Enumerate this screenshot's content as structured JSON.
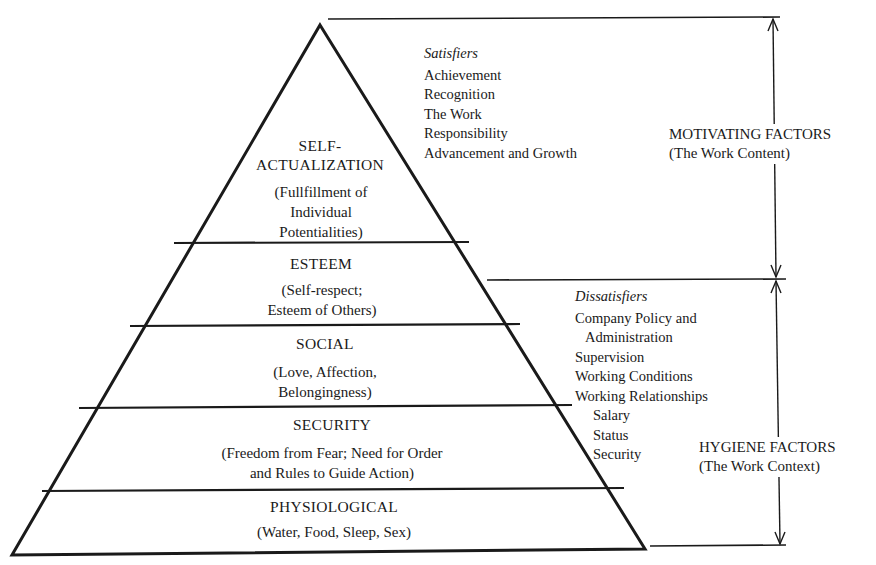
{
  "pyramid": {
    "tiers": [
      {
        "title_lines": [
          "SELF-",
          "ACTUALIZATION"
        ],
        "desc_lines": [
          "(Fullfillment of",
          "Individual",
          "Potentialities)"
        ]
      },
      {
        "title_lines": [
          "ESTEEM"
        ],
        "desc_lines": [
          "(Self-respect;",
          "Esteem of Others)"
        ]
      },
      {
        "title_lines": [
          "SOCIAL"
        ],
        "desc_lines": [
          "(Love, Affection,",
          "Belongingness)"
        ]
      },
      {
        "title_lines": [
          "SECURITY"
        ],
        "desc_lines": [
          "(Freedom from Fear; Need for Order",
          "and Rules to Guide Action)"
        ]
      },
      {
        "title_lines": [
          "PHYSIOLOGICAL"
        ],
        "desc_lines": [
          "(Water, Food, Sleep, Sex)"
        ]
      }
    ]
  },
  "satisfiers": {
    "heading": "Satisfiers",
    "items": [
      "Achievement",
      "Recognition",
      "The Work",
      "Responsibility",
      "Advancement and Growth"
    ]
  },
  "dissatisfiers": {
    "heading": "Dissatisfiers",
    "items": [
      {
        "text": "Company Policy and",
        "indent": 0
      },
      {
        "text": "Administration",
        "indent": 1
      },
      {
        "text": "Supervision",
        "indent": 0
      },
      {
        "text": "Working Conditions",
        "indent": 0
      },
      {
        "text": "Working Relationships",
        "indent": 0
      },
      {
        "text": "Salary",
        "indent": 2
      },
      {
        "text": "Status",
        "indent": 2
      },
      {
        "text": "Security",
        "indent": 2
      }
    ]
  },
  "factors": {
    "motivating": {
      "title": "MOTIVATING FACTORS",
      "subtitle": "(The Work Content)"
    },
    "hygiene": {
      "title": "HYGIENE FACTORS",
      "subtitle": "(The Work Context)"
    }
  }
}
